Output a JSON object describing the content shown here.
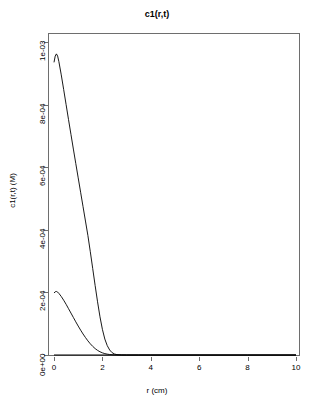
{
  "chart_data": {
    "type": "line",
    "title": "c1(r,t)",
    "xlabel": "r (cm)",
    "ylabel": "c1(r,t) (M)",
    "xlim": [
      0,
      10
    ],
    "ylim": [
      0,
      0.001
    ],
    "grid": false,
    "legend": "none",
    "xticks": [
      "0",
      "2",
      "4",
      "6",
      "8",
      "10"
    ],
    "xtick_values": [
      0,
      2,
      4,
      6,
      8,
      10
    ],
    "yticks": [
      "0e+00",
      "2e-04",
      "4e-04",
      "6e-04",
      "8e-04",
      "1e-03"
    ],
    "ytick_values": [
      0,
      0.0002,
      0.0004,
      0.0006,
      0.0008,
      0.001
    ],
    "series": [
      {
        "name": "curve-1",
        "x": [
          0.0,
          0.05,
          0.1,
          0.15,
          0.2,
          0.3,
          0.4,
          0.5,
          0.6,
          0.7,
          0.8,
          0.9,
          1.0,
          1.1,
          1.2,
          1.3,
          1.4,
          1.5,
          1.6,
          1.7,
          1.8,
          1.9,
          2.0,
          2.1,
          2.2,
          2.3,
          2.4,
          2.5,
          2.6,
          2.8,
          3.0,
          3.5,
          4.0,
          5.0,
          6.0,
          8.0,
          10.0
        ],
        "y": [
          0.000935,
          0.000955,
          0.000962,
          0.000955,
          0.000938,
          0.000895,
          0.000848,
          0.0008,
          0.000752,
          0.000705,
          0.000658,
          0.000612,
          0.000566,
          0.00052,
          0.000474,
          0.000428,
          0.000382,
          0.00033,
          0.000276,
          0.000222,
          0.00017,
          0.000122,
          8.2e-05,
          5.1e-05,
          3e-05,
          1.6e-05,
          7.5e-06,
          3.2e-06,
          1.2e-06,
          2e-07,
          0.0,
          0.0,
          0.0,
          0.0,
          0.0,
          0.0,
          0.0
        ]
      },
      {
        "name": "curve-2",
        "x": [
          0.0,
          0.05,
          0.1,
          0.15,
          0.2,
          0.3,
          0.4,
          0.5,
          0.6,
          0.7,
          0.8,
          0.9,
          1.0,
          1.1,
          1.2,
          1.3,
          1.4,
          1.5,
          1.6,
          1.7,
          1.8,
          1.9,
          2.0,
          2.1,
          2.2,
          2.3,
          2.4,
          2.5,
          2.6,
          2.8,
          3.0,
          3.5,
          4.0,
          5.0,
          6.0,
          8.0,
          10.0
        ],
        "y": [
          0.000198,
          0.000202,
          0.000203,
          0.000201,
          0.000197,
          0.000187,
          0.000175,
          0.000162,
          0.000148,
          0.000134,
          0.00012,
          0.000106,
          9.25e-05,
          7.95e-05,
          6.72e-05,
          5.58e-05,
          4.52e-05,
          3.58e-05,
          2.75e-05,
          2.05e-05,
          1.48e-05,
          1.03e-05,
          6.9e-06,
          4.4e-06,
          2.7e-06,
          1.6e-06,
          9e-07,
          4e-07,
          2e-07,
          4e-08,
          0.0,
          0.0,
          0.0,
          0.0,
          0.0,
          0.0,
          0.0
        ]
      },
      {
        "name": "curve-3-baseline",
        "x": [
          0.0,
          10.0
        ],
        "y": [
          0.0,
          0.0
        ]
      }
    ]
  }
}
